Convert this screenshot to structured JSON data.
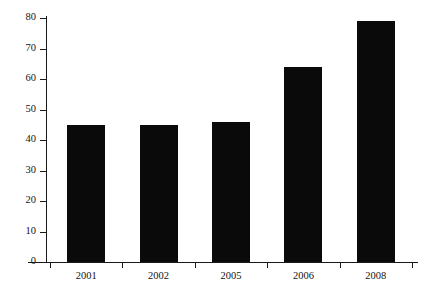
{
  "chart_data": {
    "type": "bar",
    "title": "",
    "subtitle": "",
    "xlabel": "",
    "ylabel": "",
    "categories": [
      "2001",
      "2002",
      "2005",
      "2006",
      "2008"
    ],
    "values": [
      45,
      45,
      46,
      64,
      79
    ],
    "series": [
      {
        "name": "",
        "values": [
          45,
          45,
          46,
          64,
          79
        ]
      }
    ],
    "ylim": [
      0,
      80
    ],
    "y_ticks": [
      0,
      10,
      20,
      30,
      40,
      50,
      60,
      70,
      80
    ],
    "y_tick_labels": [
      "0",
      "10",
      "20",
      "30",
      "40",
      "50",
      "60",
      "70",
      "80"
    ],
    "x_tick_labels": [
      "2001",
      "2002",
      "2005",
      "2006",
      "2008"
    ],
    "grid": false,
    "legend": false,
    "legend_position": "none",
    "annotations": [],
    "colors": {
      "bar_fill": "#0a0a0a",
      "axis": "#1a1a1a",
      "text": "#141414",
      "background": "#ffffff"
    }
  }
}
